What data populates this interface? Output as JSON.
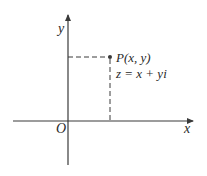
{
  "diagram": {
    "axes": {
      "x_label": "x",
      "y_label": "y",
      "origin_label": "O"
    },
    "point": {
      "label": "P(x, y)",
      "equation": "z = x + yi"
    },
    "colors": {
      "line": "#3a3a3a",
      "text": "#2a2a2a",
      "background": "#ffffff"
    }
  }
}
